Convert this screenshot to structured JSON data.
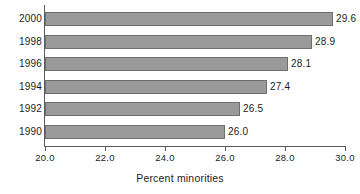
{
  "chart_data": {
    "type": "bar",
    "orientation": "horizontal",
    "title": "",
    "xlabel": "Percent minorities",
    "ylabel": "",
    "categories": [
      "2000",
      "1998",
      "1996",
      "1994",
      "1992",
      "1990"
    ],
    "values": [
      29.6,
      28.9,
      28.1,
      27.4,
      26.5,
      26.0
    ],
    "value_labels": [
      "29.6",
      "28.9",
      "28.1",
      "27.4",
      "26.5",
      "26.0"
    ],
    "xlim": [
      20.0,
      30.0
    ],
    "xticks": [
      20.0,
      22.0,
      24.0,
      26.0,
      28.0,
      30.0
    ],
    "xtick_labels": [
      "20.0",
      "22.0",
      "24.0",
      "26.0",
      "28.0",
      "30.0"
    ],
    "grid": false,
    "legend": null,
    "bar_color": "#9a9a9a",
    "bar_edge_color": "#6e6e6e",
    "axis_color": "#5b5b5b",
    "background": "#ffffff"
  }
}
